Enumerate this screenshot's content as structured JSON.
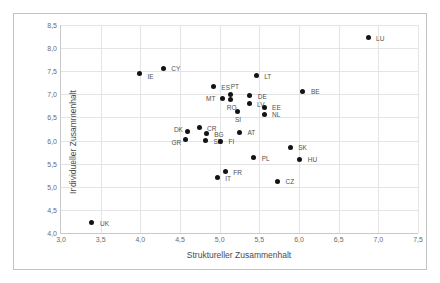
{
  "chart_data": {
    "type": "scatter",
    "title": "",
    "xlabel": "Struktureller Zusammenhalt",
    "ylabel": "Individueller Zusammenhalt",
    "xlim": [
      3.0,
      7.5
    ],
    "ylim": [
      4.0,
      8.5
    ],
    "xticks": [
      "3,0",
      "3,5",
      "4,0",
      "4,5",
      "5,0",
      "5,5",
      "6,0",
      "6,5",
      "7,0",
      "7,5"
    ],
    "xtick_values": [
      3.0,
      3.5,
      4.0,
      4.5,
      5.0,
      5.5,
      6.0,
      6.5,
      7.0,
      7.5
    ],
    "yticks": [
      "4,0",
      "4,5",
      "5,0",
      "5,5",
      "6,0",
      "6,5",
      "7,0",
      "7,5",
      "8,0",
      "8,5"
    ],
    "ytick_values": [
      4.0,
      4.5,
      5.0,
      5.5,
      6.0,
      6.5,
      7.0,
      7.5,
      8.0,
      8.5
    ],
    "grid": true,
    "legend": false,
    "points": [
      {
        "label": "LU",
        "x": 6.87,
        "y": 8.22,
        "lx": 8,
        "ly": 0
      },
      {
        "label": "CY",
        "x": 4.29,
        "y": 7.56,
        "lx": 8,
        "ly": 0
      },
      {
        "label": "IE",
        "x": 3.99,
        "y": 7.44,
        "lx": 8,
        "ly": 2
      },
      {
        "label": "LT",
        "x": 5.46,
        "y": 7.4,
        "lx": 8,
        "ly": 0
      },
      {
        "label": "ES",
        "x": 4.92,
        "y": 7.16,
        "lx": 8,
        "ly": 0
      },
      {
        "label": "BE",
        "x": 6.05,
        "y": 7.07,
        "lx": 8,
        "ly": 0
      },
      {
        "label": "PT",
        "x": 5.14,
        "y": 7.0,
        "lx": 0,
        "ly": -8
      },
      {
        "label": "DE",
        "x": 5.38,
        "y": 6.97,
        "lx": 8,
        "ly": 0
      },
      {
        "label": "MT",
        "x": 5.03,
        "y": 6.92,
        "lx": -16,
        "ly": 0
      },
      {
        "label": "RO",
        "x": 5.14,
        "y": 6.88,
        "lx": -4,
        "ly": 7
      },
      {
        "label": "LV",
        "x": 5.37,
        "y": 6.8,
        "lx": 8,
        "ly": 0
      },
      {
        "label": "EE",
        "x": 5.56,
        "y": 6.72,
        "lx": 8,
        "ly": 0
      },
      {
        "label": "SI",
        "x": 5.23,
        "y": 6.62,
        "lx": -3,
        "ly": 7
      },
      {
        "label": "NL",
        "x": 5.56,
        "y": 6.57,
        "lx": 8,
        "ly": 0
      },
      {
        "label": "CR",
        "x": 4.74,
        "y": 6.28,
        "lx": 8,
        "ly": 0
      },
      {
        "label": "DK",
        "x": 4.6,
        "y": 6.19,
        "lx": -14,
        "ly": -3
      },
      {
        "label": "AT",
        "x": 5.25,
        "y": 6.18,
        "lx": 8,
        "ly": 0
      },
      {
        "label": "BG",
        "x": 4.83,
        "y": 6.15,
        "lx": 8,
        "ly": 0
      },
      {
        "label": "GR",
        "x": 4.57,
        "y": 6.03,
        "lx": -14,
        "ly": 3
      },
      {
        "label": "SE",
        "x": 4.82,
        "y": 6.0,
        "lx": 8,
        "ly": 0
      },
      {
        "label": "FI",
        "x": 5.01,
        "y": 5.99,
        "lx": 8,
        "ly": 0
      },
      {
        "label": "SK",
        "x": 5.89,
        "y": 5.85,
        "lx": 8,
        "ly": 0
      },
      {
        "label": "PL",
        "x": 5.43,
        "y": 5.63,
        "lx": 8,
        "ly": 0
      },
      {
        "label": "HU",
        "x": 6.01,
        "y": 5.6,
        "lx": 8,
        "ly": 0
      },
      {
        "label": "FR",
        "x": 5.07,
        "y": 5.32,
        "lx": 8,
        "ly": 0
      },
      {
        "label": "IT",
        "x": 4.97,
        "y": 5.19,
        "lx": 8,
        "ly": 0
      },
      {
        "label": "CZ",
        "x": 5.73,
        "y": 5.12,
        "lx": 8,
        "ly": 0
      },
      {
        "label": "UK",
        "x": 3.39,
        "y": 4.22,
        "lx": 8,
        "ly": 0
      }
    ]
  }
}
